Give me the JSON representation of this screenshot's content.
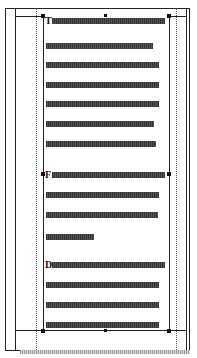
{
  "document": {
    "page": {
      "lines": [
        {
          "top": 19,
          "left": 8,
          "width": 113,
          "initial": "T"
        },
        {
          "top": 43,
          "left": 2,
          "width": 107
        },
        {
          "top": 62,
          "left": 2,
          "width": 113
        },
        {
          "top": 82,
          "left": 2,
          "width": 113
        },
        {
          "top": 101,
          "left": 2,
          "width": 113
        },
        {
          "top": 121,
          "left": 2,
          "width": 108
        },
        {
          "top": 141,
          "left": 2,
          "width": 110
        },
        {
          "top": 162,
          "left": 8,
          "width": 113,
          "initial": "F"
        },
        {
          "top": 182,
          "left": 2,
          "width": 113
        },
        {
          "top": 202,
          "left": 2,
          "width": 112
        },
        {
          "top": 222,
          "left": 2,
          "width": 48
        },
        {
          "top": 243,
          "left": 8,
          "width": 113,
          "initial": "D"
        },
        {
          "top": 264,
          "left": 2,
          "width": 113
        },
        {
          "top": 284,
          "left": 2,
          "width": 113
        },
        {
          "top": 304,
          "left": 2,
          "width": 113
        }
      ]
    },
    "initials": {
      "first": "T",
      "second": "F",
      "third": "D"
    }
  }
}
